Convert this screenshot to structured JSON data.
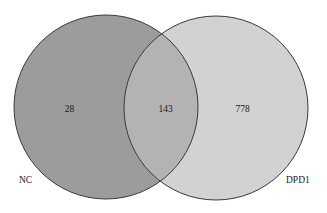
{
  "chart_data": {
    "type": "venn",
    "title": "",
    "sets": [
      {
        "name": "NC",
        "only_count": 28,
        "color": "#9c9c9c",
        "stroke": "#3a3a3a",
        "cx": 106,
        "cy": 107,
        "r": 92
      },
      {
        "name": "DPD1",
        "only_count": 778,
        "color": "#d2d2d2",
        "stroke": "#3a3a3a",
        "cx": 216,
        "cy": 108,
        "r": 92
      }
    ],
    "intersections": [
      {
        "sets": [
          "NC",
          "DPD1"
        ],
        "count": 143,
        "color": "#b3b3b3"
      }
    ]
  },
  "labels": {
    "nc_name": "NC",
    "dpd1_name": "DPD1",
    "nc_only": "28",
    "overlap": "143",
    "dpd1_only": "778"
  }
}
